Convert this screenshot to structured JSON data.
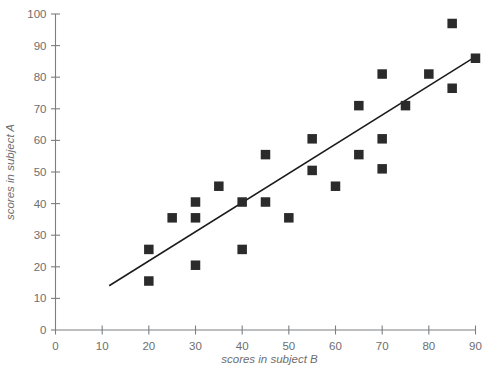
{
  "chart_data": {
    "type": "scatter",
    "title": "",
    "subtitle": "",
    "xlabel": "scores in subject B",
    "ylabel": "scores in subject A",
    "xlim": [
      0,
      90
    ],
    "ylim": [
      0,
      100
    ],
    "xticks": [
      0,
      10,
      20,
      30,
      40,
      50,
      60,
      70,
      80,
      90
    ],
    "yticks": [
      0,
      10,
      20,
      30,
      40,
      50,
      60,
      70,
      80,
      90,
      100
    ],
    "xtick_labels": [
      "0",
      "10",
      "20",
      "30",
      "40",
      "50",
      "60",
      "70",
      "80",
      "90"
    ],
    "ytick_labels": [
      "0",
      "10",
      "20",
      "30",
      "40",
      "50",
      "60",
      "70",
      "80",
      "90",
      "100"
    ],
    "grid": false,
    "legend": false,
    "legend_position": "none",
    "marker_shape": "square",
    "marker_color": "#2b2b2b",
    "axis_color": "#7d7e80",
    "text_color": "#6d6e70",
    "trendline_color": "#1a1a1a",
    "points": [
      {
        "x": 20,
        "y": 25.5
      },
      {
        "x": 20,
        "y": 15.5
      },
      {
        "x": 25,
        "y": 35.5
      },
      {
        "x": 30,
        "y": 40.5
      },
      {
        "x": 30,
        "y": 35.5
      },
      {
        "x": 30,
        "y": 20.5
      },
      {
        "x": 35,
        "y": 45.5
      },
      {
        "x": 40,
        "y": 40.5
      },
      {
        "x": 40,
        "y": 25.5
      },
      {
        "x": 45,
        "y": 55.5
      },
      {
        "x": 45,
        "y": 40.5
      },
      {
        "x": 50,
        "y": 35.5
      },
      {
        "x": 55,
        "y": 60.5
      },
      {
        "x": 55,
        "y": 50.5
      },
      {
        "x": 60,
        "y": 45.5
      },
      {
        "x": 65,
        "y": 71
      },
      {
        "x": 65,
        "y": 55.5
      },
      {
        "x": 70,
        "y": 81
      },
      {
        "x": 70,
        "y": 60.5
      },
      {
        "x": 70,
        "y": 51
      },
      {
        "x": 75,
        "y": 71
      },
      {
        "x": 80,
        "y": 81
      },
      {
        "x": 85,
        "y": 97
      },
      {
        "x": 85,
        "y": 76.5
      },
      {
        "x": 90,
        "y": 86
      }
    ],
    "trendline": {
      "x0": 11.5,
      "y0": 14,
      "x1": 90,
      "y1": 86.5
    }
  }
}
